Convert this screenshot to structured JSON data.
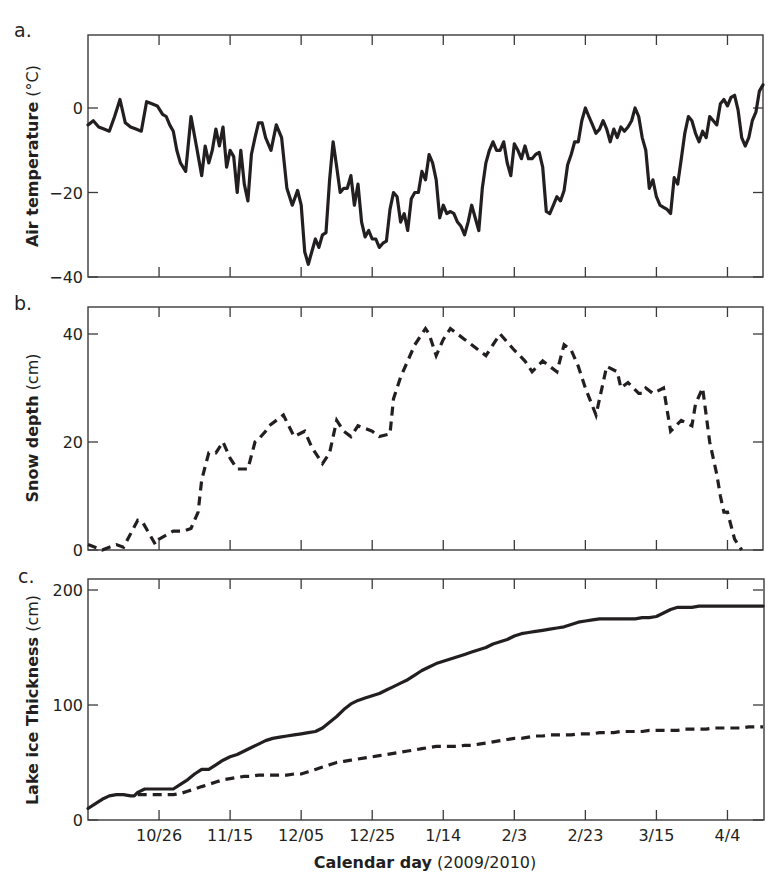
{
  "figure": {
    "x_axis": {
      "label_bold": "Calendar day",
      "label_normal": " (2009/2010)",
      "tick_labels": [
        "10/26",
        "11/15",
        "12/05",
        "12/25",
        "1/14",
        "2/3",
        "2/23",
        "3/15",
        "4/4"
      ],
      "tick_days": [
        20,
        40,
        60,
        80,
        100,
        120,
        140,
        160,
        180
      ],
      "range_days": [
        0,
        190
      ],
      "day0": "10/06"
    },
    "panels": [
      {
        "letter": "a.",
        "ylabel_bold": "Air temperature",
        "ylabel_normal": " (°C)"
      },
      {
        "letter": "b.",
        "ylabel_bold": "Snow depth",
        "ylabel_normal": " (cm)"
      },
      {
        "letter": "c.",
        "ylabel_bold": "Lake ice Thickness",
        "ylabel_normal": " (cm)"
      }
    ]
  },
  "chart_data": [
    {
      "type": "line",
      "panel": "a.",
      "title": "",
      "xlabel": "Calendar day (2009/2010)",
      "ylabel": "Air temperature (°C)",
      "ylim": [
        -40,
        17
      ],
      "yticks": [
        0,
        -20,
        -40
      ],
      "xticks": [
        "10/26",
        "11/15",
        "12/05",
        "12/25",
        "1/14",
        "2/3",
        "2/23",
        "3/15",
        "4/4"
      ],
      "grid": false,
      "series": [
        {
          "name": "Air temperature",
          "style": "solid",
          "x": [
            0,
            1.5,
            3,
            4.5,
            6,
            7.5,
            9,
            10.5,
            12,
            13.5,
            15,
            16.5,
            18,
            19.5,
            21,
            22,
            23,
            24,
            25,
            26,
            27.5,
            29,
            30.5,
            32,
            33,
            34,
            35,
            36,
            37,
            38,
            39,
            40,
            41,
            42,
            43,
            44,
            45,
            46,
            47,
            48,
            49,
            50,
            51.5,
            53,
            54.5,
            56,
            57.5,
            59,
            60,
            61,
            62,
            63,
            64,
            65,
            66,
            67,
            68,
            69,
            70,
            71,
            72,
            73,
            74,
            75,
            76,
            77,
            78,
            79,
            80,
            81,
            82,
            83,
            84,
            85,
            86,
            87,
            88,
            89,
            90,
            91,
            92,
            93,
            94,
            95,
            96,
            97,
            98,
            99,
            100,
            101,
            102,
            103,
            104,
            105,
            106,
            107,
            108,
            109,
            110,
            111,
            112,
            113,
            114,
            115,
            116,
            117,
            118,
            119,
            120,
            121,
            122,
            123,
            124,
            125,
            126,
            127,
            128,
            129,
            130,
            131,
            132,
            133,
            134,
            135,
            136,
            137,
            138,
            139,
            140,
            141,
            142,
            143,
            144,
            145,
            146,
            147,
            148,
            149,
            150,
            151,
            152,
            153,
            154,
            155,
            156,
            157,
            158,
            159,
            160,
            161,
            162,
            163,
            164,
            165,
            166,
            167,
            168,
            169,
            170,
            171,
            172,
            173,
            174,
            175,
            176,
            177,
            178,
            179,
            180,
            181,
            182,
            183,
            184,
            185,
            186,
            187,
            188,
            189,
            190
          ],
          "y": [
            -4,
            -3,
            -4.5,
            -5,
            -5.5,
            -2,
            2,
            -3.5,
            -4.5,
            -5,
            -5.5,
            1.5,
            1,
            0.5,
            -1.5,
            -2,
            -4,
            -5.5,
            -10,
            -13,
            -15,
            -2,
            -9,
            -16,
            -9,
            -13,
            -10,
            -5,
            -9,
            -4.5,
            -14,
            -10,
            -11.5,
            -20,
            -10,
            -18,
            -22,
            -11,
            -7,
            -3.5,
            -3.5,
            -7,
            -10,
            -4,
            -7,
            -19,
            -23,
            -19.5,
            -23,
            -34,
            -37,
            -34,
            -31,
            -33,
            -30,
            -29.5,
            -17,
            -8,
            -14,
            -20,
            -19,
            -19,
            -16,
            -23,
            -18,
            -27,
            -30.5,
            -29,
            -31,
            -31,
            -33,
            -32,
            -31.5,
            -24,
            -20,
            -21,
            -27,
            -25,
            -29,
            -21.5,
            -20,
            -20,
            -15,
            -17,
            -11,
            -13,
            -17,
            -26,
            -23,
            -25,
            -24.5,
            -25,
            -27,
            -28,
            -30,
            -27,
            -23,
            -26,
            -29,
            -19,
            -13,
            -10,
            -8,
            -10,
            -10,
            -8,
            -13,
            -16,
            -8.5,
            -10,
            -12,
            -9,
            -12,
            -12,
            -11,
            -10.5,
            -14,
            -24.5,
            -25,
            -23,
            -21,
            -22,
            -19.5,
            -13.5,
            -11,
            -8,
            -8,
            -3,
            0,
            -2,
            -4,
            -6,
            -5,
            -3,
            -5,
            -8,
            -5,
            -7,
            -4.5,
            -5.5,
            -4.5,
            -3,
            0,
            -2,
            -7,
            -10,
            -19,
            -17,
            -21,
            -23,
            -23.5,
            -24,
            -25,
            -16.5,
            -18,
            -12,
            -6,
            -2,
            -3,
            -6,
            -8,
            -5.5,
            -7,
            -2,
            -3,
            -4,
            1,
            2,
            0.5,
            2.5,
            3,
            -0.5,
            -7,
            -9,
            -7,
            -3,
            -1,
            4,
            5.5,
            3.5,
            3,
            4,
            5,
            5,
            4
          ]
        }
      ]
    },
    {
      "type": "line",
      "panel": "b.",
      "title": "",
      "xlabel": "Calendar day (2009/2010)",
      "ylabel": "Snow depth (cm)",
      "ylim": [
        0,
        45
      ],
      "yticks": [
        0,
        20,
        40
      ],
      "xticks": [
        "10/26",
        "11/15",
        "12/05",
        "12/25",
        "1/14",
        "2/3",
        "2/23",
        "3/15",
        "4/4"
      ],
      "grid": false,
      "series": [
        {
          "name": "Snow depth",
          "style": "dashed",
          "x": [
            0,
            2,
            4,
            6,
            8,
            10,
            14,
            15.5,
            19,
            20,
            24,
            27,
            29,
            31,
            32,
            34,
            36,
            38,
            40,
            42,
            45,
            47,
            48,
            50,
            51,
            55,
            58,
            61,
            63,
            66,
            68,
            70,
            72,
            74,
            76,
            78,
            80,
            82,
            85,
            86,
            88,
            92,
            95,
            96,
            98,
            100,
            102,
            104,
            106,
            108,
            110,
            112,
            116,
            120,
            123,
            125,
            128,
            132,
            134,
            136,
            138,
            140,
            143,
            146,
            149,
            150,
            152,
            155,
            156,
            157,
            159,
            162,
            164,
            167,
            170,
            171,
            173,
            175,
            177,
            178,
            179,
            180,
            182,
            184,
            186,
            187
          ],
          "y": [
            1,
            0.5,
            0,
            0.5,
            1,
            0.5,
            5.5,
            5,
            1,
            2,
            3.5,
            3.5,
            4,
            7,
            13,
            18,
            18,
            20,
            17,
            15,
            15,
            20,
            20.5,
            22,
            23,
            25,
            21,
            22,
            19,
            16,
            18,
            24,
            22,
            21,
            23,
            22.5,
            22,
            21,
            21.5,
            28,
            32,
            38,
            41,
            40,
            36,
            39,
            41,
            40,
            39,
            38,
            37,
            36,
            40,
            37,
            35,
            33,
            35,
            33,
            38,
            37,
            34,
            30,
            25,
            34,
            33,
            30,
            31,
            29,
            29,
            30,
            29,
            30,
            22,
            24,
            23,
            27,
            30,
            20,
            14,
            10,
            7,
            7,
            2,
            0
          ]
        }
      ]
    },
    {
      "type": "line",
      "panel": "c.",
      "title": "",
      "xlabel": "Calendar day (2009/2010)",
      "ylabel": "Lake ice Thickness (cm)",
      "ylim": [
        0,
        209
      ],
      "yticks": [
        0,
        100,
        200
      ],
      "xticks": [
        "10/26",
        "11/15",
        "12/05",
        "12/25",
        "1/14",
        "2/3",
        "2/23",
        "3/15",
        "4/4"
      ],
      "grid": false,
      "series": [
        {
          "name": "Lake ice thickness (solid)",
          "style": "solid",
          "x": [
            0,
            2,
            4,
            6,
            8,
            10,
            12,
            13,
            14,
            16,
            18,
            20,
            22,
            24,
            26,
            28,
            30,
            32,
            34,
            36,
            38,
            40,
            42,
            44,
            46,
            48,
            50,
            52,
            54,
            56,
            58,
            60,
            62,
            64,
            66,
            68,
            70,
            72,
            74,
            76,
            78,
            80,
            82,
            84,
            86,
            88,
            90,
            92,
            94,
            96,
            98,
            100,
            102,
            104,
            106,
            108,
            110,
            112,
            114,
            116,
            118,
            120,
            122,
            124,
            126,
            128,
            130,
            132,
            134,
            136,
            138,
            140,
            142,
            144,
            146,
            148,
            150,
            152,
            154,
            156,
            158,
            160,
            162,
            164,
            166,
            168,
            170,
            172,
            174,
            176,
            178,
            180,
            182,
            184,
            186,
            188,
            190
          ],
          "y": [
            10,
            14,
            18,
            21,
            22,
            22,
            21,
            21,
            24,
            27,
            27,
            27,
            27,
            27,
            31,
            35,
            40,
            44,
            44,
            48,
            52,
            55,
            57,
            60,
            63,
            66,
            69,
            71,
            72,
            73,
            74,
            75,
            76,
            77,
            80,
            85,
            90,
            96,
            101,
            104,
            106,
            108,
            110,
            113,
            116,
            119,
            122,
            126,
            130,
            133,
            136,
            138,
            140,
            142,
            144,
            146,
            148,
            150,
            153,
            155,
            157,
            160,
            162,
            163,
            164,
            165,
            166,
            167,
            168,
            170,
            172,
            173,
            174,
            175,
            175,
            175,
            175,
            175,
            175,
            176,
            176,
            177,
            180,
            183,
            185,
            185,
            185,
            186,
            186,
            186,
            186,
            186,
            186,
            186,
            186,
            186,
            186
          ],
          "note": "solid line"
        },
        {
          "name": "Lake ice thickness (dashed)",
          "style": "dashed",
          "x": [
            14,
            16,
            18,
            20,
            22,
            24,
            26,
            28,
            30,
            32,
            34,
            36,
            38,
            40,
            42,
            44,
            46,
            48,
            50,
            52,
            54,
            56,
            58,
            60,
            62,
            64,
            66,
            68,
            70,
            72,
            74,
            76,
            78,
            80,
            82,
            84,
            86,
            88,
            90,
            92,
            94,
            96,
            98,
            100,
            102,
            104,
            106,
            108,
            110,
            112,
            114,
            116,
            118,
            120,
            122,
            124,
            126,
            128,
            130,
            132,
            134,
            136,
            138,
            140,
            142,
            144,
            146,
            148,
            150,
            152,
            154,
            156,
            158,
            160,
            162,
            164,
            166,
            168,
            170,
            172,
            174,
            176,
            178,
            180,
            182,
            184,
            186,
            188,
            190
          ],
          "y": [
            22,
            22,
            22,
            22,
            22,
            22,
            23,
            25,
            27,
            29,
            31,
            33,
            35,
            36,
            37,
            38,
            38,
            39,
            39,
            39,
            39,
            39,
            40,
            40,
            42,
            44,
            46,
            48,
            50,
            51,
            52,
            53,
            54,
            55,
            56,
            57,
            58,
            59,
            60,
            61,
            62,
            63,
            64,
            64,
            64,
            64,
            65,
            65,
            66,
            67,
            68,
            69,
            70,
            71,
            71,
            72,
            73,
            73,
            74,
            74,
            74,
            74,
            75,
            75,
            75,
            76,
            76,
            76,
            77,
            77,
            77,
            77,
            78,
            78,
            78,
            78,
            78,
            79,
            79,
            79,
            79,
            80,
            80,
            80,
            80,
            80,
            81,
            81,
            81
          ]
        }
      ]
    }
  ]
}
